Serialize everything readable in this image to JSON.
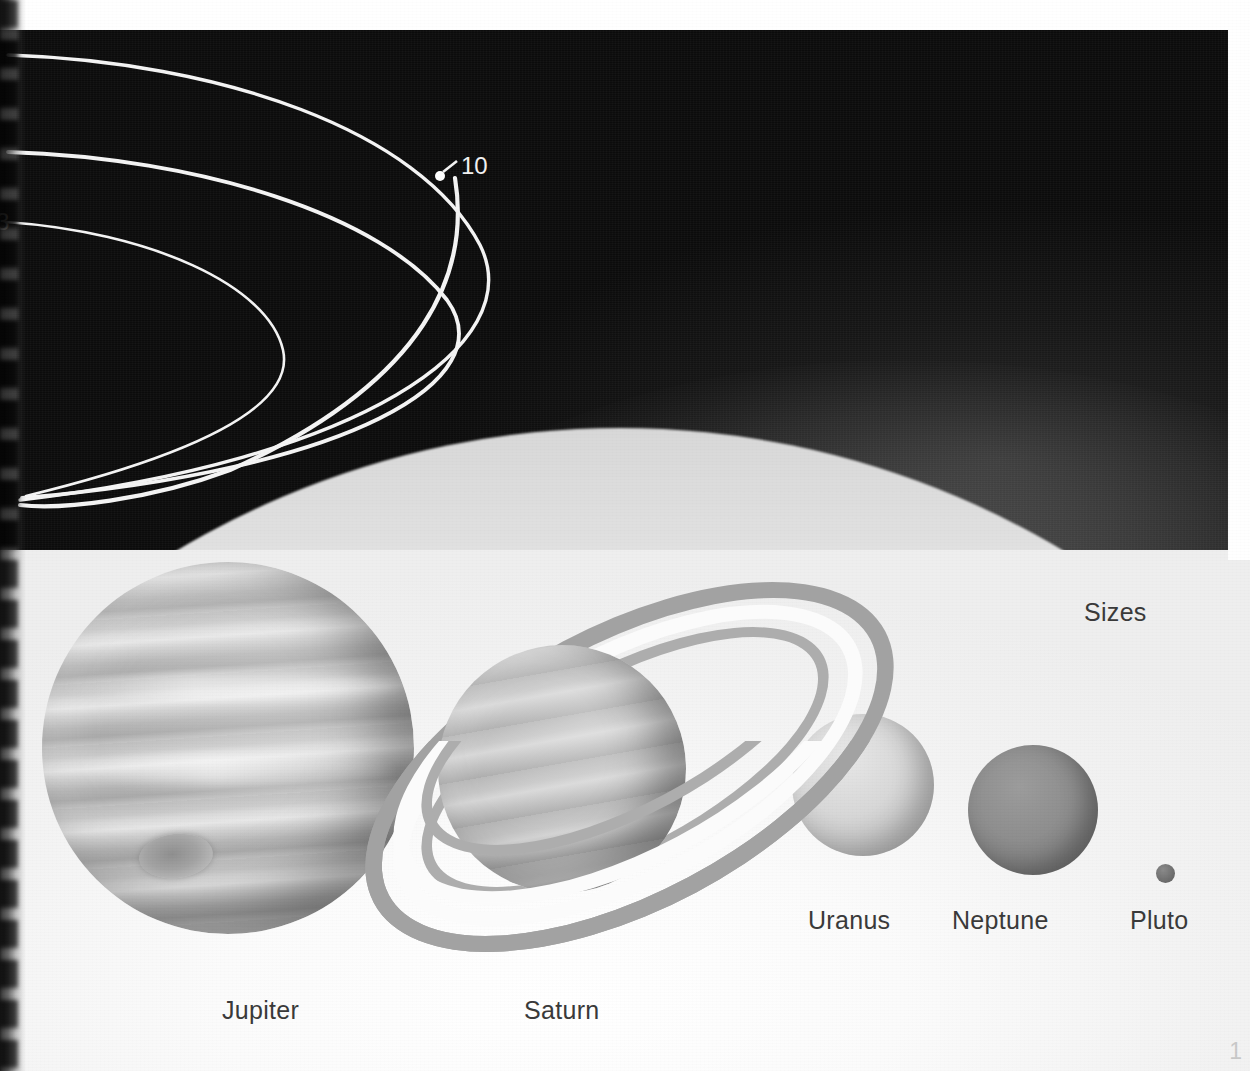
{
  "page": {
    "title": "Sizes",
    "page_number": "1",
    "background_color": "#ffffff",
    "sky_color": "#0d0d0d",
    "lower_field_color": "#f2f2f2"
  },
  "sky": {
    "orbit_labels": [
      {
        "name": "orbit-label-10",
        "text": "10",
        "has_marker_dot": true,
        "has_leader_tick": true
      },
      {
        "name": "orbit-label-3",
        "text": "3",
        "has_marker_dot": false,
        "has_leader_tick": false
      }
    ],
    "orbit_arc_count": 4
  },
  "diagram": {
    "heading": "Sizes",
    "planets": [
      {
        "name": "jupiter",
        "label": "Jupiter",
        "color": "#c0c0c0",
        "has_rings": false,
        "has_great_red_spot": true,
        "relative_size": "largest"
      },
      {
        "name": "saturn",
        "label": "Saturn",
        "color": "#b6b6b6",
        "has_rings": true,
        "ring_colors": [
          "#a2a2a2",
          "#fbfbfb",
          "#adadad"
        ],
        "relative_size": "second-largest"
      },
      {
        "name": "uranus",
        "label": "Uranus",
        "color": "#d8d8d8",
        "has_rings": false,
        "relative_size": "medium"
      },
      {
        "name": "neptune",
        "label": "Neptune",
        "color": "#8e8e8e",
        "has_rings": false,
        "relative_size": "medium"
      },
      {
        "name": "pluto",
        "label": "Pluto",
        "color": "#6f6f6f",
        "has_rings": false,
        "relative_size": "smallest"
      }
    ]
  }
}
